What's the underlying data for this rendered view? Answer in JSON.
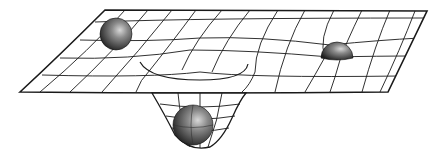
{
  "diagram": {
    "elements": [
      {
        "id": "grid-sheet",
        "label": "flexible grid sheet (spacetime fabric)"
      },
      {
        "id": "sphere-left",
        "label": "small mass on sheet (left)"
      },
      {
        "id": "sphere-right",
        "label": "small mass on sheet (right)"
      },
      {
        "id": "sphere-center",
        "label": "heavy mass in deep well"
      }
    ],
    "colors": {
      "line": "#1a1a1a",
      "sphere_dark": "#2a2a2a",
      "sphere_light": "#bdbdbd",
      "background": "#ffffff"
    }
  }
}
